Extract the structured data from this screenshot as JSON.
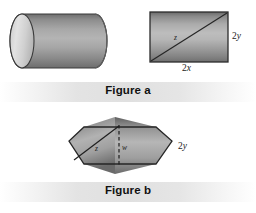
{
  "figure_a": {
    "caption": "Figure a",
    "cylinder": {
      "name": "solid cylinder"
    },
    "rectangle": {
      "width_label_prefix": "2",
      "width_label_var": "x",
      "height_label_prefix": "2",
      "height_label_var": "y",
      "diagonal_label": "z"
    }
  },
  "figure_b": {
    "caption": "Figure b",
    "hexagon": {
      "diagonal_label": "z",
      "center_label": "w",
      "height_label_prefix": "2",
      "height_label_var": "y"
    }
  },
  "colors": {
    "background": "#ffffff",
    "outline": "#2b2b2b",
    "shade_dark": "#6f6f6f",
    "shade_mid": "#9a9a9a",
    "shade_light": "#d8d8d8",
    "caption_band": "#e2e2e2",
    "text": "#111111"
  }
}
